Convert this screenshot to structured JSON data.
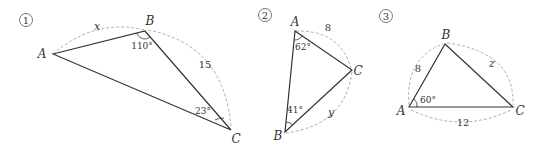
{
  "figures": [
    {
      "number": "①",
      "vertices": {
        "A": "A",
        "B": "B",
        "C": "C"
      },
      "side_AB": "x",
      "side_BC": "15",
      "angle_B": "110°",
      "angle_C": "23°"
    },
    {
      "number": "②",
      "vertices": {
        "A": "A",
        "B": "B",
        "C": "C"
      },
      "side_AC": "8",
      "side_BC": "y",
      "angle_A": "62°",
      "angle_B": "41°"
    },
    {
      "number": "③",
      "vertices": {
        "A": "A",
        "B": "B",
        "C": "C"
      },
      "side_AB": "8",
      "side_BC": "z",
      "side_AC": "12",
      "angle_A": "60°"
    }
  ],
  "colors": {
    "line": "#333333",
    "dashed": "#999999",
    "text": "#333333"
  }
}
